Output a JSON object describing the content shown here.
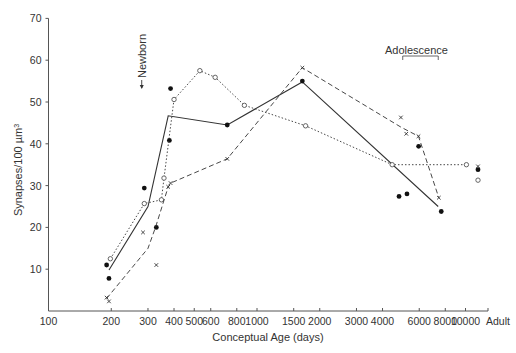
{
  "chart_data": {
    "type": "line",
    "title": "",
    "xlabel": "Conceptual Age (days)",
    "ylabel": "Synapses/100 µm³",
    "ylabel_base": "Synapses/100 µm",
    "ylabel_sup": "3",
    "xscale": "log",
    "xlim": [
      100,
      10000
    ],
    "ylim": [
      0,
      70
    ],
    "grid": false,
    "x_ticks": [
      100,
      200,
      300,
      400,
      500,
      600,
      800,
      1000,
      1500,
      2000,
      3000,
      4000,
      6000,
      8000,
      10000
    ],
    "x_tick_labels": [
      "100",
      "200",
      "300",
      "400",
      "500",
      "600",
      "800",
      "1000",
      "1500",
      "2000",
      "3000",
      "4000",
      "6000",
      "8000",
      "10000",
      "Adult"
    ],
    "y_ticks": [
      10,
      20,
      30,
      40,
      50,
      60,
      70
    ],
    "y_tick_labels": [
      "10",
      "20",
      "30",
      "40",
      "50",
      "60",
      "70"
    ],
    "annotations": [
      {
        "text": "Newborn",
        "x": 280,
        "type": "arrow-down-vertical-text"
      },
      {
        "text": "Adolescence",
        "x_range": [
          5000,
          7400
        ],
        "type": "bracket"
      }
    ],
    "series": [
      {
        "name": "filled-circles",
        "line_style": "solid",
        "marker": "filled-circle",
        "line": [
          [
            195,
            9.8
          ],
          [
            300,
            25
          ],
          [
            375,
            46.7
          ],
          [
            720,
            44.5
          ],
          [
            1650,
            54.8
          ],
          [
            7400,
            25
          ]
        ],
        "points": [
          [
            190,
            11
          ],
          [
            195,
            7.8
          ],
          [
            288,
            29.4
          ],
          [
            329,
            20
          ],
          [
            380,
            40.8
          ],
          [
            385,
            53.2
          ],
          [
            720,
            44.5
          ],
          [
            1650,
            55
          ],
          [
            4800,
            27.4
          ],
          [
            5240,
            28
          ],
          [
            5960,
            39.4
          ],
          [
            7650,
            23.8
          ],
          [
            "Adult",
            33.8
          ]
        ]
      },
      {
        "name": "open-circles",
        "line_style": "dotted",
        "marker": "open-circle",
        "line": [
          [
            198,
            12.5
          ],
          [
            288,
            25.7
          ],
          [
            348,
            26.6
          ],
          [
            358,
            31.8
          ],
          [
            400,
            50.6
          ],
          [
            532,
            57.5
          ],
          [
            630,
            55.9
          ],
          [
            870,
            49.2
          ],
          [
            1710,
            44.3
          ],
          [
            4450,
            35
          ],
          [
            10100,
            35
          ]
        ],
        "points": [
          [
            198,
            12.5
          ],
          [
            288,
            25.7
          ],
          [
            348,
            26.6
          ],
          [
            358,
            31.8
          ],
          [
            400,
            50.6
          ],
          [
            532,
            57.5
          ],
          [
            630,
            55.9
          ],
          [
            870,
            49.2
          ],
          [
            1710,
            44.3
          ],
          [
            4450,
            35
          ],
          [
            10100,
            35
          ],
          [
            "Adult",
            31.3
          ]
        ]
      },
      {
        "name": "crosses",
        "line_style": "dashed",
        "marker": "cross",
        "line": [
          [
            190,
            3
          ],
          [
            300,
            15
          ],
          [
            326,
            20
          ],
          [
            375,
            29.7
          ],
          [
            385,
            30.6
          ],
          [
            720,
            36.4
          ],
          [
            1650,
            58.2
          ],
          [
            4900,
            44
          ],
          [
            5950,
            41.8
          ],
          [
            7450,
            27.1
          ]
        ],
        "points": [
          [
            190,
            3.2
          ],
          [
            195,
            2.3
          ],
          [
            284,
            18.8
          ],
          [
            329,
            11
          ],
          [
            375,
            29.7
          ],
          [
            385,
            30.6
          ],
          [
            720,
            36.4
          ],
          [
            1650,
            58.2
          ],
          [
            4900,
            46.3
          ],
          [
            5200,
            42.4
          ],
          [
            5950,
            41.8
          ],
          [
            7450,
            27.1
          ],
          [
            "Adult",
            34.6
          ]
        ]
      }
    ]
  }
}
